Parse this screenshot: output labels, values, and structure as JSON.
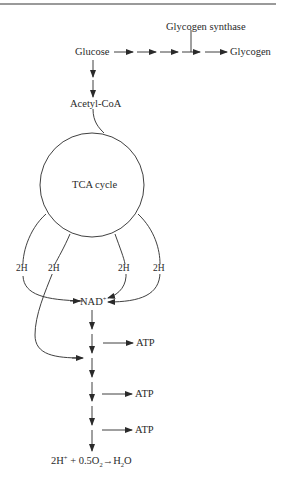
{
  "figure": {
    "nodes": {
      "glucose": "Glucose",
      "glycogen": "Glycogen",
      "glycogen_synthase": "Glycogen synthase",
      "acetyl_coa": "Acetyl-CoA",
      "tca_cycle": "TCA cycle",
      "nad": "NAD",
      "nad_charge": "+",
      "atp_labels": [
        "ATP",
        "ATP",
        "ATP"
      ],
      "hydrogen_labels": [
        "2H",
        "2H",
        "2H",
        "2H"
      ]
    },
    "final_equation": {
      "h_part": "2H",
      "h_charge": "+",
      "o_part": " + 0.5O",
      "o_sub": "2",
      "arrow": "→",
      "water_h": "H",
      "water_sub": "2",
      "water_o": "O"
    },
    "line_color": "#2a2a2a",
    "rule_color": "#9a9a9a"
  }
}
